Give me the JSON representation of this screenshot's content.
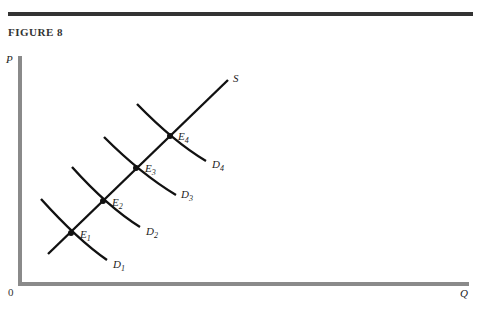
{
  "figure": {
    "title": "FIGURE 8",
    "y_axis_label": "P",
    "x_axis_label": "Q",
    "origin_label": "0"
  },
  "curves": {
    "supply": {
      "label": "S"
    },
    "demand": [
      {
        "label": "D",
        "sub": "1"
      },
      {
        "label": "D",
        "sub": "2"
      },
      {
        "label": "D",
        "sub": "3"
      },
      {
        "label": "D",
        "sub": "4"
      }
    ]
  },
  "equilibria": [
    {
      "label": "E",
      "sub": "1"
    },
    {
      "label": "E",
      "sub": "2"
    },
    {
      "label": "E",
      "sub": "3"
    },
    {
      "label": "E",
      "sub": "4"
    }
  ],
  "colors": {
    "axis": "#8a8a8a",
    "curve": "#111111",
    "rule": "#333333"
  }
}
